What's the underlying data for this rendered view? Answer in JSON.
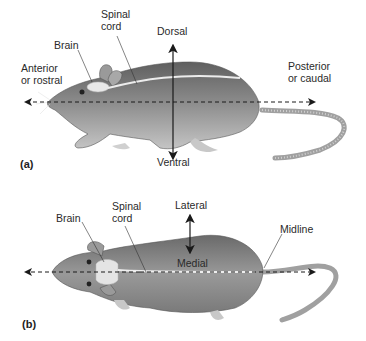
{
  "figure": {
    "panel_a": {
      "tag": "(a)",
      "view": "lateral side view of rat",
      "labels": {
        "brain": "Brain",
        "spinal_cord_line1": "Spinal",
        "spinal_cord_line2": "cord",
        "anterior_line1": "Anterior",
        "anterior_line2": "or rostral",
        "dorsal": "Dorsal",
        "ventral": "Ventral",
        "posterior_line1": "Posterior",
        "posterior_line2": "or caudal"
      }
    },
    "panel_b": {
      "tag": "(b)",
      "view": "dorsal top view of rat",
      "labels": {
        "brain": "Brain",
        "spinal_cord_line1": "Spinal",
        "spinal_cord_line2": "cord",
        "lateral": "Lateral",
        "medial": "Medial",
        "midline": "Midline"
      }
    },
    "colors": {
      "body_fur": "#8a8a8a",
      "body_dark": "#5f5f5f",
      "body_light": "#b8b8b8",
      "brain_spinal": "#e6e6e6",
      "arrow": "#1a1a1a",
      "tail": "#a8a8a8"
    }
  }
}
